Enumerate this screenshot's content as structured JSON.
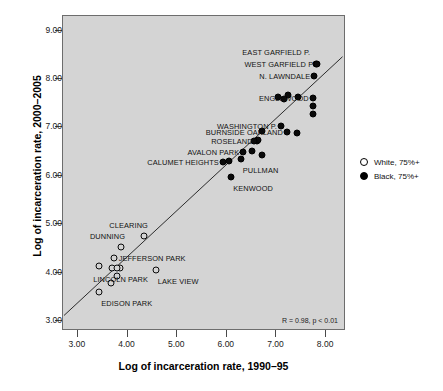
{
  "chart_data": {
    "type": "scatter",
    "title": "",
    "xlabel": "Log of incarceration rate, 1990–95",
    "ylabel": "Log of incarceration rate, 2000–2005",
    "xlim": [
      2.7,
      8.4
    ],
    "ylim": [
      2.8,
      9.3
    ],
    "xticks": [
      "3.00",
      "4.00",
      "5.00",
      "6.00",
      "7.00",
      "8.00"
    ],
    "yticks": [
      "3.00",
      "4.00",
      "5.00",
      "6.00",
      "7.00",
      "8.00",
      "9.00"
    ],
    "xtick_values": [
      3,
      4,
      5,
      6,
      7,
      8
    ],
    "ytick_values": [
      3,
      4,
      5,
      6,
      7,
      8,
      9
    ],
    "grid": false,
    "annotation": "R = 0.98, p < 0.01",
    "legend_position": "right",
    "legend": [
      {
        "label": "White, 75%+",
        "marker": "open-circle",
        "color": "#ffffff"
      },
      {
        "label": "Black, 75%+",
        "marker": "filled-circle",
        "color": "#000000"
      }
    ],
    "trendline": {
      "x": [
        2.72,
        8.33
      ],
      "y": [
        3.12,
        8.46
      ]
    },
    "series": [
      {
        "name": "White, 75%+",
        "marker": "open-circle",
        "points": [
          {
            "label": "CLEARING",
            "x": 4.33,
            "y": 4.77,
            "label_pos": "above-left"
          },
          {
            "label": "DUNNING",
            "x": 3.87,
            "y": 4.54,
            "label_pos": "above-left"
          },
          {
            "label": "JEFFERSON PARK",
            "x": 3.72,
            "y": 4.31,
            "label_pos": "right"
          },
          {
            "label": "LINCOLN PARK",
            "x": 3.85,
            "y": 4.11,
            "label_pos": "below"
          },
          {
            "label": "LAKE VIEW",
            "x": 4.57,
            "y": 4.05,
            "label_pos": "below-right"
          },
          {
            "label": "EDISON PARK",
            "x": 3.43,
            "y": 3.6,
            "label_pos": "below-right"
          },
          {
            "label": "",
            "x": 3.43,
            "y": 4.14,
            "label_pos": "none"
          },
          {
            "label": "",
            "x": 3.69,
            "y": 4.1,
            "label_pos": "none"
          },
          {
            "label": "",
            "x": 3.79,
            "y": 4.11,
            "label_pos": "none"
          },
          {
            "label": "",
            "x": 3.66,
            "y": 3.8,
            "label_pos": "none"
          },
          {
            "label": "",
            "x": 3.78,
            "y": 3.93,
            "label_pos": "none"
          }
        ]
      },
      {
        "name": "Black, 75%+",
        "marker": "filled-circle",
        "points": [
          {
            "label": "EAST GARFIELD P.",
            "x": 7.8,
            "y": 8.31,
            "label_pos": "left-far"
          },
          {
            "label": "WEST GARFIELD P",
            "x": 7.82,
            "y": 8.3,
            "label_pos": "left"
          },
          {
            "label": "N. LAWNDALE",
            "x": 7.76,
            "y": 8.06,
            "label_pos": "left"
          },
          {
            "label": "ENGLEWOOD",
            "x": 7.73,
            "y": 7.61,
            "label_pos": "left"
          },
          {
            "label": "WASHINGTON P.",
            "x": 7.09,
            "y": 7.04,
            "label_pos": "left"
          },
          {
            "label": "BURNSIDE OAKLAND",
            "x": 7.21,
            "y": 6.9,
            "label_pos": "left"
          },
          {
            "label": "ROSELAND",
            "x": 6.6,
            "y": 6.72,
            "label_pos": "left"
          },
          {
            "label": "AVALON PARK",
            "x": 6.33,
            "y": 6.5,
            "label_pos": "left"
          },
          {
            "label": "CALUMET HEIGHTS",
            "x": 5.92,
            "y": 6.28,
            "label_pos": "left"
          },
          {
            "label": "PULLMAN",
            "x": 6.28,
            "y": 6.34,
            "label_pos": "below-right"
          },
          {
            "label": "KENWOOD",
            "x": 6.09,
            "y": 5.98,
            "label_pos": "below-right"
          },
          {
            "label": "",
            "x": 7.23,
            "y": 7.67,
            "label_pos": "none"
          },
          {
            "label": "",
            "x": 7.15,
            "y": 7.59,
            "label_pos": "none"
          },
          {
            "label": "",
            "x": 7.04,
            "y": 7.63,
            "label_pos": "none"
          },
          {
            "label": "",
            "x": 7.43,
            "y": 7.63,
            "label_pos": "none"
          },
          {
            "label": "",
            "x": 7.73,
            "y": 7.45,
            "label_pos": "none"
          },
          {
            "label": "",
            "x": 7.74,
            "y": 7.28,
            "label_pos": "none"
          },
          {
            "label": "",
            "x": 7.41,
            "y": 6.89,
            "label_pos": "none"
          },
          {
            "label": "",
            "x": 6.7,
            "y": 6.93,
            "label_pos": "none"
          },
          {
            "label": "",
            "x": 6.62,
            "y": 6.75,
            "label_pos": "none"
          },
          {
            "label": "",
            "x": 6.55,
            "y": 6.72,
            "label_pos": "none"
          },
          {
            "label": "",
            "x": 6.5,
            "y": 6.51,
            "label_pos": "none"
          },
          {
            "label": "",
            "x": 6.7,
            "y": 6.43,
            "label_pos": "none"
          },
          {
            "label": "",
            "x": 6.04,
            "y": 6.3,
            "label_pos": "none"
          }
        ]
      }
    ]
  }
}
